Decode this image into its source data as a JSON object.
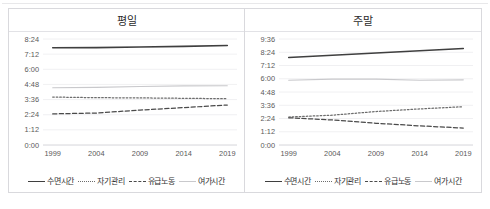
{
  "figure": {
    "panels": [
      {
        "id": "weekday",
        "title": "평일",
        "chart_data": {
          "type": "line",
          "title": "평일",
          "xlabel": "",
          "ylabel": "",
          "x": [
            1999,
            2004,
            2009,
            2014,
            2019
          ],
          "xticklabels": [
            "1999",
            "2004",
            "2009",
            "2014",
            "2019"
          ],
          "yticklabels": [
            "0:00",
            "1:12",
            "2:24",
            "3:36",
            "4:48",
            "6:00",
            "7:12",
            "8:24"
          ],
          "ytickvalues": [
            0,
            72,
            144,
            216,
            288,
            360,
            432,
            504
          ],
          "ylim": [
            0,
            504
          ],
          "yunit": "minutes (h:mm)",
          "grid": true,
          "legend_position": "bottom",
          "series": [
            {
              "name": "수면시간",
              "style": "solid",
              "color": "#3f3f3f",
              "values": [
                462,
                463,
                466,
                469,
                473
              ],
              "labels": [
                "7:42",
                "7:43",
                "7:46",
                "7:49",
                "7:53"
              ]
            },
            {
              "name": "자기관리",
              "style": "dotted",
              "color": "#6d6d6d",
              "values": [
                228,
                225,
                224,
                222,
                220
              ],
              "labels": [
                "3:48",
                "3:45",
                "3:44",
                "3:42",
                "3:40"
              ]
            },
            {
              "name": "유급노동",
              "style": "dashed",
              "color": "#4a4a4a",
              "values": [
                148,
                152,
                166,
                178,
                190
              ],
              "labels": [
                "2:28",
                "2:32",
                "2:46",
                "2:58",
                "3:10"
              ]
            },
            {
              "name": "여가시간",
              "style": "light-solid",
              "color": "#c9c9cc",
              "values": [
                272,
                274,
                278,
                281,
                282
              ],
              "labels": [
                "4:32",
                "4:34",
                "4:38",
                "4:41",
                "4:42"
              ]
            }
          ]
        }
      },
      {
        "id": "weekend",
        "title": "주말",
        "chart_data": {
          "type": "line",
          "title": "주말",
          "xlabel": "",
          "ylabel": "",
          "x": [
            1999,
            2004,
            2009,
            2014,
            2019
          ],
          "xticklabels": [
            "1999",
            "2004",
            "2009",
            "2014",
            "2019"
          ],
          "yticklabels": [
            "0:00",
            "1:12",
            "2:24",
            "3:36",
            "4:48",
            "6:00",
            "7:12",
            "8:24",
            "9:36"
          ],
          "ytickvalues": [
            0,
            72,
            144,
            216,
            288,
            360,
            432,
            504,
            576
          ],
          "ylim": [
            0,
            576
          ],
          "yunit": "minutes (h:mm)",
          "grid": true,
          "legend_position": "bottom",
          "series": [
            {
              "name": "수면시간",
              "style": "solid",
              "color": "#3f3f3f",
              "values": [
                476,
                488,
                500,
                512,
                524
              ],
              "labels": [
                "7:56",
                "8:08",
                "8:20",
                "8:32",
                "8:44"
              ]
            },
            {
              "name": "자기관리",
              "style": "dotted",
              "color": "#6d6d6d",
              "values": [
                152,
                162,
                182,
                196,
                208
              ],
              "labels": [
                "2:32",
                "2:42",
                "3:02",
                "3:16",
                "3:28"
              ]
            },
            {
              "name": "유급노동",
              "style": "dashed",
              "color": "#4a4a4a",
              "values": [
                148,
                136,
                118,
                104,
                92
              ],
              "labels": [
                "2:28",
                "2:16",
                "1:58",
                "1:44",
                "1:32"
              ]
            },
            {
              "name": "여가시간",
              "style": "light-solid",
              "color": "#c9c9cc",
              "values": [
                352,
                358,
                358,
                352,
                354
              ],
              "labels": [
                "5:52",
                "5:58",
                "5:58",
                "5:52",
                "5:54"
              ]
            }
          ]
        }
      }
    ],
    "legend": [
      {
        "label": "수면시간",
        "style": "solid"
      },
      {
        "label": "자기관리",
        "style": "dotted"
      },
      {
        "label": "유급노동",
        "style": "dashed"
      },
      {
        "label": "여가시간",
        "style": "light-solid"
      }
    ]
  }
}
